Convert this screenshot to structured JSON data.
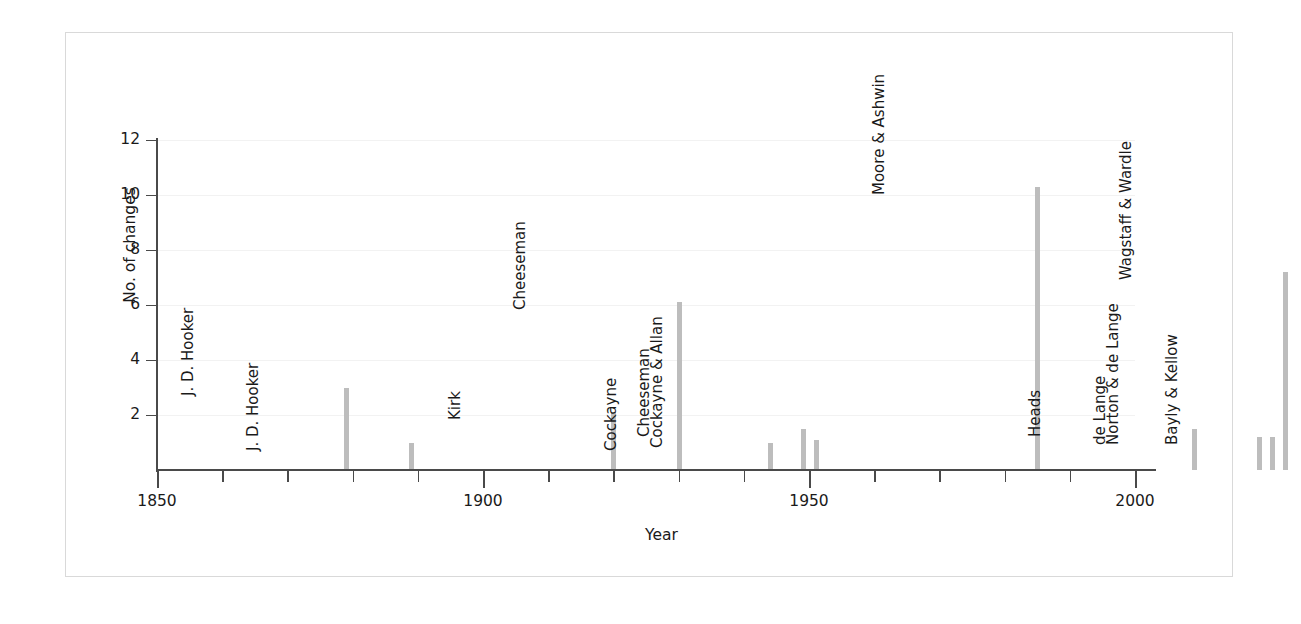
{
  "chart_data": {
    "type": "bar",
    "title": "",
    "subtitle": "",
    "xlabel": "Year",
    "ylabel": "No. of changes",
    "xlim": [
      1845,
      2012
    ],
    "ylim": [
      0,
      12
    ],
    "grid": true,
    "legend": "none",
    "bar_color": "#bdbdbd",
    "x_ticks_major": [
      1850,
      1900,
      1950,
      2000
    ],
    "x_ticks_minor_step": 10,
    "x_tick_labels": [
      "1850",
      "1900",
      "1950",
      "2000"
    ],
    "y_ticks": [
      2,
      4,
      6,
      8,
      10,
      12
    ],
    "y_tick_labels": [
      "2",
      "4",
      "6",
      "8",
      "10",
      "12"
    ],
    "points": [
      {
        "year": 1855,
        "value": 3.0,
        "label": "J. D. Hooker"
      },
      {
        "year": 1865,
        "value": 1.0,
        "label": "J. D. Hooker"
      },
      {
        "year": 1896,
        "value": 2.1,
        "label": "Kirk"
      },
      {
        "year": 1906,
        "value": 6.1,
        "label": "Cheeseman"
      },
      {
        "year": 1920,
        "value": 1.0,
        "label": "Cockayne"
      },
      {
        "year": 1925,
        "value": 1.5,
        "label": "Cheeseman"
      },
      {
        "year": 1927,
        "value": 1.1,
        "label": "Cockayne & Allan"
      },
      {
        "year": 1961,
        "value": 10.3,
        "label": "Moore & Ashwin"
      },
      {
        "year": 1985,
        "value": 1.5,
        "label": "Heads"
      },
      {
        "year": 1995,
        "value": 1.2,
        "label": "de Lange"
      },
      {
        "year": 1997,
        "value": 1.2,
        "label": "Norton & de Lange"
      },
      {
        "year": 1999,
        "value": 7.2,
        "label": "Wagstaff & Wardle"
      },
      {
        "year": 2006,
        "value": 1.2,
        "label": "Bayly & Kellow"
      }
    ]
  }
}
